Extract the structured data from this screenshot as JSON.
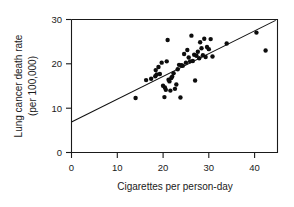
{
  "chart_data": {
    "type": "scatter",
    "title": "",
    "xlabel": "Cigarettes per person-day",
    "ylabel": "Lung cancer death rate (per 100,000)",
    "ylabel_line1": "Lung cancer death rate",
    "ylabel_line2": "(per 100,000)",
    "xlim": [
      0,
      45
    ],
    "ylim": [
      0,
      30.5
    ],
    "xticks": [
      0,
      10,
      20,
      30,
      40
    ],
    "xtick_labels": [
      "0",
      "10",
      "20",
      "30",
      "40"
    ],
    "yticks": [
      0,
      10,
      20,
      30
    ],
    "ytick_labels": [
      "0",
      "10",
      "20",
      "30"
    ],
    "grid": false,
    "legend": "none",
    "frame": "box",
    "point_color": "#0d0d0d",
    "line_color": "#111111",
    "axis_color": "#1a1a1a",
    "background_color": "#ffffff",
    "marker": "filled-circle",
    "marker_size": 2.2,
    "trend_line": {
      "type": "linear-fit",
      "x_start": 0,
      "y_start": 7.0,
      "x_end": 44.6,
      "y_end": 30.3,
      "slope": 0.522,
      "intercept": 7.0
    },
    "x": [
      14.0,
      16.3,
      17.4,
      18.3,
      18.4,
      18.6,
      19.0,
      19.3,
      19.7,
      20.0,
      20.3,
      20.4,
      20.6,
      20.8,
      21.0,
      21.2,
      21.4,
      21.6,
      21.8,
      22.0,
      22.3,
      22.6,
      22.9,
      23.2,
      23.5,
      23.8,
      24.0,
      24.3,
      24.6,
      25.0,
      25.3,
      25.6,
      25.9,
      26.2,
      26.5,
      26.8,
      27.0,
      27.3,
      27.6,
      27.9,
      28.1,
      28.4,
      28.7,
      29.0,
      29.3,
      29.6,
      30.0,
      30.4,
      30.8,
      33.9,
      40.4,
      42.4
    ],
    "y": [
      12.5,
      16.6,
      16.9,
      17.5,
      18.9,
      17.9,
      19.6,
      18.0,
      20.6,
      15.3,
      12.7,
      14.9,
      14.4,
      20.9,
      25.8,
      16.7,
      16.3,
      14.2,
      17.1,
      17.4,
      18.2,
      14.6,
      15.6,
      19.1,
      20.1,
      12.6,
      20.0,
      19.9,
      22.6,
      20.6,
      23.5,
      21.8,
      20.9,
      26.8,
      21.0,
      22.4,
      16.5,
      22.2,
      23.1,
      21.6,
      25.3,
      23.9,
      22.3,
      26.1,
      21.9,
      24.2,
      23.7,
      26.0,
      22.0,
      25.0,
      27.5,
      23.4
    ]
  }
}
